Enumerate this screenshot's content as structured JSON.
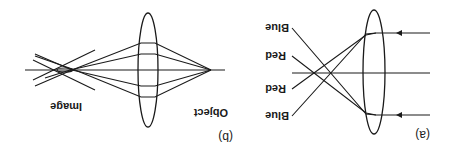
{
  "figure": {
    "orientation": "rotated-180",
    "colors": {
      "ink": "#1a1a1a",
      "background": "#ffffff"
    },
    "panel_a": {
      "label": "(a)",
      "title": "Chromatic aberration: parallel rays through lens",
      "ray_labels": [
        "Blue",
        "Red",
        "Red",
        "Blue"
      ]
    },
    "panel_b": {
      "label": "(b)",
      "title": "Point object imaged by lens",
      "object_label": "Object",
      "image_label": "Image"
    }
  }
}
